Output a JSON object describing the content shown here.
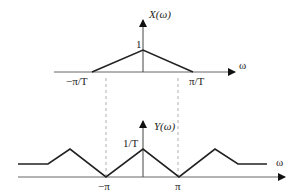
{
  "top_plot": {
    "y_label": "X(ω)",
    "x_label": "ω",
    "peak_label": "1",
    "left_tick": "−π/T",
    "right_tick": "π/T"
  },
  "bottom_plot": {
    "y_label": "Y(ω)",
    "x_label": "ω",
    "peak_label": "1/T",
    "left_tick": "−π",
    "right_tick": "π"
  },
  "colors": {
    "line": "#222222",
    "axis": "#555555",
    "dashed": "#999999"
  }
}
